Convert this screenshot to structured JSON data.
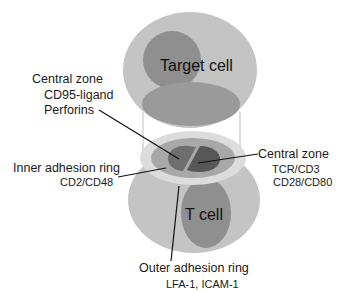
{
  "diagram": {
    "cells": {
      "target": {
        "label": "Target cell"
      },
      "tcell": {
        "label": "T cell"
      }
    },
    "labels": {
      "central_zone_left": {
        "title": "Central zone",
        "lines": [
          "CD95-ligand",
          "Perforins"
        ]
      },
      "inner_ring": {
        "title": "Inner adhesion ring",
        "lines": [
          "CD2/CD48"
        ]
      },
      "central_zone_right": {
        "title": "Central zone",
        "lines": [
          "TCR/CD3",
          "CD28/CD80"
        ]
      },
      "outer_ring": {
        "title": "Outer adhesion ring",
        "lines": [
          "LFA-1, ICAM-1"
        ]
      }
    },
    "colors": {
      "cell_body": "#c4c4c4",
      "nucleus": "#8f8f8f",
      "contact_patch": "#9a9a9a",
      "outer_ring": "#dcdcdc",
      "inner_ring": "#a8a8a8",
      "central_left": "#6e6e6e",
      "central_right": "#575757",
      "leader_line": "#111111"
    }
  }
}
